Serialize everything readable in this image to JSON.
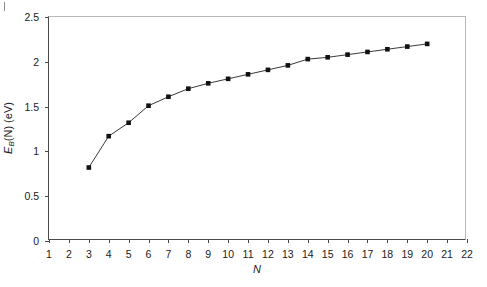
{
  "figure": {
    "corner_mark": "tick"
  },
  "axes": {
    "x": {
      "label": "N",
      "ticks": [
        1,
        2,
        3,
        4,
        5,
        6,
        7,
        8,
        9,
        10,
        11,
        12,
        13,
        14,
        15,
        16,
        17,
        18,
        19,
        20,
        21,
        22
      ],
      "min": 1,
      "max": 22
    },
    "y": {
      "label_main": "E",
      "label_sub": "B",
      "label_rest": "(N) (eV)",
      "ticks": [
        0,
        0.5,
        1,
        1.5,
        2,
        2.5
      ],
      "tick_labels": [
        "0",
        "0.5",
        "1",
        "1.5",
        "2",
        "2.5"
      ],
      "min": 0,
      "max": 2.5
    }
  },
  "style": {
    "marker_color": "#111111",
    "line_color": "#222222",
    "frame_color": "#b9b9b9",
    "axis_color": "#4a4a4a"
  },
  "chart_data": {
    "type": "line",
    "title": "",
    "subtitle": "",
    "xlabel": "N",
    "ylabel": "E_B(N) (eV)",
    "xlim": [
      1,
      22
    ],
    "ylim": [
      0,
      2.5
    ],
    "grid": false,
    "legend": null,
    "marker": "filled-square",
    "series": [
      {
        "name": "E_B(N)",
        "x": [
          3,
          4,
          5,
          6,
          7,
          8,
          9,
          10,
          11,
          12,
          13,
          14,
          15,
          16,
          17,
          18,
          19,
          20
        ],
        "values": [
          0.82,
          1.17,
          1.32,
          1.51,
          1.61,
          1.7,
          1.76,
          1.81,
          1.86,
          1.91,
          1.96,
          2.03,
          2.05,
          2.08,
          2.11,
          2.14,
          2.17,
          2.2
        ]
      }
    ]
  }
}
